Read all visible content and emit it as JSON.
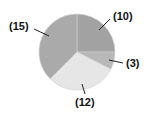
{
  "chart_data": {
    "type": "pie",
    "title": "",
    "categories": [
      "(10)",
      "(3)",
      "(12)",
      "(15)"
    ],
    "values": [
      10,
      3,
      12,
      15
    ],
    "start_angle": "12 o'clock, clockwise",
    "colors": [
      "#a2a2a2",
      "#b8b8b8",
      "#e6e6e6",
      "#aaaaaa"
    ],
    "labels": [
      {
        "text": "(10)",
        "x": 113,
        "y": 18
      },
      {
        "text": "(3)",
        "x": 125,
        "y": 66
      },
      {
        "text": "(12)",
        "x": 78,
        "y": 103
      },
      {
        "text": "(15)",
        "x": 10,
        "y": 28
      }
    ],
    "legend": "none",
    "grid": false
  }
}
